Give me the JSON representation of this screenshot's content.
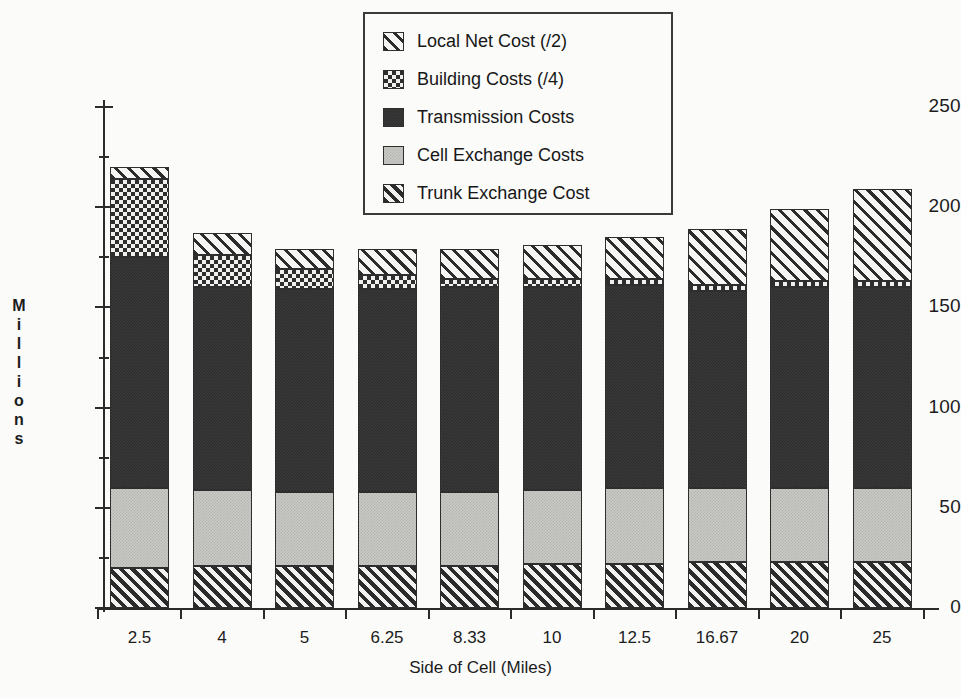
{
  "chart_data": {
    "type": "bar",
    "subtype": "stacked",
    "title": "",
    "xlabel": "Side of Cell (Miles)",
    "ylabel": "Millions",
    "categories": [
      "2.5",
      "4",
      "5",
      "6.25",
      "8.33",
      "10",
      "12.5",
      "16.67",
      "20",
      "25"
    ],
    "ylim": [
      0,
      250
    ],
    "yticks": [
      0,
      50,
      100,
      150,
      200,
      250
    ],
    "ytick_labels": [
      "0",
      "50",
      "100",
      "150",
      "200",
      "250"
    ],
    "grid": false,
    "legend_position": "top-center",
    "series": [
      {
        "name": "Trunk Exchange Cost",
        "pattern": "diagonal-hatch-fine",
        "values": [
          20,
          21,
          21,
          21,
          21,
          22,
          22,
          23,
          23,
          23
        ]
      },
      {
        "name": "Cell Exchange Costs",
        "pattern": "light-gray-fill",
        "values": [
          40,
          38,
          37,
          37,
          37,
          37,
          38,
          37,
          37,
          37
        ]
      },
      {
        "name": "Transmission Costs",
        "pattern": "solid-dark-fill",
        "values": [
          115,
          101,
          101,
          101,
          102,
          101,
          101,
          98,
          100,
          100
        ]
      },
      {
        "name": "Building Costs (/4)",
        "pattern": "checkerboard",
        "values": [
          39,
          16,
          10,
          7,
          4,
          4,
          3,
          3,
          3,
          3
        ]
      },
      {
        "name": "Local Net Cost (/2)",
        "pattern": "diagonal-hatch-wide",
        "values": [
          6,
          11,
          10,
          13,
          15,
          17,
          21,
          28,
          36,
          46
        ]
      }
    ],
    "totals": [
      220,
      187,
      179,
      179,
      179,
      181,
      185,
      189,
      199,
      209
    ]
  },
  "axes": {
    "y_title_chars": [
      "M",
      "i",
      "l",
      "l",
      "i",
      "o",
      "n",
      "s"
    ],
    "x_title": "Side of Cell (Miles)"
  },
  "legend": {
    "items": [
      {
        "label": "Local Net Cost (/2)",
        "pattern": "diagonal-hatch-wide"
      },
      {
        "label": "Building Costs (/4)",
        "pattern": "checkerboard"
      },
      {
        "label": "Transmission Costs",
        "pattern": "solid-dark-fill"
      },
      {
        "label": "Cell Exchange Costs",
        "pattern": "light-gray-fill"
      },
      {
        "label": "Trunk Exchange Cost",
        "pattern": "diagonal-hatch-fine"
      }
    ]
  },
  "colors": {
    "ink": "#2b2b2b",
    "paper": "#fbfbfa",
    "dark_fill": "#3a3a3a",
    "light_fill": "#c9c9c6"
  }
}
